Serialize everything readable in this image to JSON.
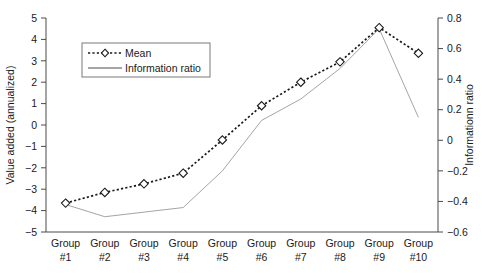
{
  "chart_data": {
    "type": "line",
    "title": "",
    "categories": [
      "Group\n#1",
      "Group\n#2",
      "Group\n#3",
      "Group\n#4",
      "Group\n#5",
      "Group\n#6",
      "Group\n#7",
      "Group\n#8",
      "Group\n#9",
      "Group\n#10"
    ],
    "category_labels": [
      {
        "top": "Group",
        "bottom": "#1"
      },
      {
        "top": "Group",
        "bottom": "#2"
      },
      {
        "top": "Group",
        "bottom": "#3"
      },
      {
        "top": "Group",
        "bottom": "#4"
      },
      {
        "top": "Group",
        "bottom": "#5"
      },
      {
        "top": "Group",
        "bottom": "#6"
      },
      {
        "top": "Group",
        "bottom": "#7"
      },
      {
        "top": "Group",
        "bottom": "#8"
      },
      {
        "top": "Group",
        "bottom": "#9"
      },
      {
        "top": "Group",
        "bottom": "#10"
      }
    ],
    "series": [
      {
        "name": "Mean",
        "axis": "left",
        "style": "dashed-with-diamond-markers",
        "color": "#1a1a1a",
        "values": [
          -3.65,
          -3.15,
          -2.75,
          -2.25,
          -0.7,
          0.9,
          2.0,
          2.95,
          4.55,
          3.35
        ]
      },
      {
        "name": "Information ratio",
        "axis": "right",
        "style": "thin-solid",
        "color": "#9a9a9a",
        "values": [
          -0.42,
          -0.5,
          -0.47,
          -0.44,
          -0.2,
          0.13,
          0.27,
          0.47,
          0.73,
          0.15
        ]
      }
    ],
    "xlabel": "",
    "ylabel": "Value added (annualized)",
    "y2label": "Informationn ratio",
    "ylim": [
      -5,
      5
    ],
    "yticks": [
      "5",
      "4",
      "3",
      "2",
      "1",
      "0",
      "−1",
      "−2",
      "−3",
      "−4",
      "−5"
    ],
    "ytick_values": [
      5,
      4,
      3,
      2,
      1,
      0,
      -1,
      -2,
      -3,
      -4,
      -5
    ],
    "y2lim": [
      -0.6,
      0.8
    ],
    "y2ticks": [
      "0.8",
      "0.6",
      "0.4",
      "0.2",
      "0",
      "−0.2",
      "−0.4",
      "−0.6"
    ],
    "y2tick_values": [
      0.8,
      0.6,
      0.4,
      0.2,
      0,
      -0.2,
      -0.4,
      -0.6
    ],
    "grid": false,
    "legend_position": "upper-left",
    "legend": [
      "Mean",
      "Information ratio"
    ]
  },
  "legend": {
    "entries": [
      {
        "label": "Mean",
        "marker": "dashed-diamond"
      },
      {
        "label": "Information ratio",
        "marker": "solid-line"
      }
    ]
  }
}
